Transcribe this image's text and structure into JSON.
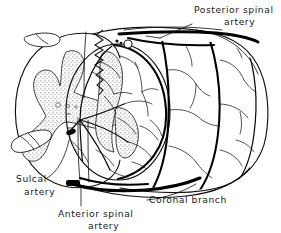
{
  "figure": {
    "background_color": "#ffffff",
    "ink_color": "#111111",
    "graymatter_fill": "#b9b9b9",
    "width": 281,
    "height": 233
  },
  "labels": {
    "posterior_spinal_artery": {
      "line1": "Posterior spinal",
      "line2": "artery"
    },
    "sulcal_artery": {
      "line1": "Sulcal",
      "line2": "artery"
    },
    "anterior_spinal_artery": {
      "line1": "Anterior spinal",
      "line2": "artery"
    },
    "coronal_branch": {
      "line1": "Coronal  branch"
    }
  },
  "structures": {
    "cord_cylinder": "spinal-cord-cylinder",
    "cross_section_face": "cord-cross-section-face",
    "gray_matter": "butterfly-gray-matter",
    "posterior_median_septum": "posterior-median-septum",
    "ventral_rootlet": "ventral-rootlet",
    "dorsal_rootlet": "dorsal-rootlet",
    "central_canal": "central-canal"
  }
}
